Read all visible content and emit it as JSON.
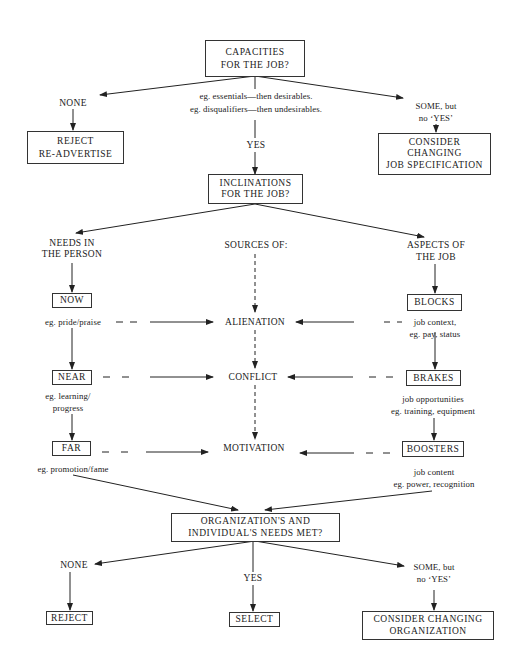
{
  "diagram": {
    "stage1": {
      "question": [
        "CAPACITIES",
        "FOR THE JOB?"
      ],
      "criteria": [
        "eg. essentials—then desirables.",
        "eg. disqualifiers—then undesirables."
      ],
      "none_label": "NONE",
      "none_action": [
        "REJECT",
        "RE-ADVERTISE"
      ],
      "yes_label": "YES",
      "some_label": [
        "SOME, but",
        "no ‘YES’"
      ],
      "some_action": [
        "CONSIDER",
        "CHANGING",
        "JOB SPECIFICATION"
      ]
    },
    "stage2": {
      "question": [
        "INCLINATIONS",
        "FOR THE JOB?"
      ],
      "left_header": [
        "NEEDS IN",
        "THE PERSON"
      ],
      "center_header": "SOURCES OF:",
      "right_header": [
        "ASPECTS OF",
        "THE JOB"
      ],
      "needs": [
        {
          "label": "NOW",
          "example": [
            "eg. pride/praise"
          ]
        },
        {
          "label": "NEAR",
          "example": [
            "eg. learning/",
            "progress"
          ]
        },
        {
          "label": "FAR",
          "example": [
            "eg. promotion/fame"
          ]
        }
      ],
      "sources": [
        "ALIENATION",
        "CONFLICT",
        "MOTIVATION"
      ],
      "aspects": [
        {
          "label": "BLOCKS",
          "example": [
            "job context,",
            "eg. pay, status"
          ]
        },
        {
          "label": "BRAKES",
          "example": [
            "job opportunities",
            "eg. training, equipment"
          ]
        },
        {
          "label": "BOOSTERS",
          "example": [
            "job content",
            "eg. power, recognition"
          ]
        }
      ]
    },
    "stage3": {
      "question": [
        "ORGANIZATION'S AND",
        "INDIVIDUAL'S NEEDS MET?"
      ],
      "none_label": "NONE",
      "none_action": "REJECT",
      "yes_label": "YES",
      "yes_action": "SELECT",
      "some_label": [
        "SOME, but",
        "no ‘YES’"
      ],
      "some_action": [
        "CONSIDER CHANGING",
        "ORGANIZATION"
      ]
    }
  }
}
